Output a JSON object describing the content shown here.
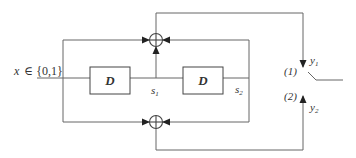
{
  "diagram": {
    "type": "convolutional-encoder",
    "input_label": "x ∈ {0,1}",
    "input_var": "x",
    "input_set": "∈ {0,1}",
    "delay_blocks": [
      {
        "id": "D1",
        "label": "D",
        "output_state": "s",
        "output_sub": "1"
      },
      {
        "id": "D2",
        "label": "D",
        "output_state": "s",
        "output_sub": "2"
      }
    ],
    "adders": [
      {
        "id": "xor-top",
        "symbol": "⊕",
        "inputs": [
          "x",
          "s1",
          "s2"
        ],
        "output": "y1"
      },
      {
        "id": "xor-bottom",
        "symbol": "⊕",
        "inputs": [
          "x",
          "s2"
        ],
        "output": "y2"
      }
    ],
    "switch": {
      "positions": [
        {
          "label": "(1)",
          "output_var": "y",
          "output_sub": "1"
        },
        {
          "label": "(2)",
          "output_var": "y",
          "output_sub": "2"
        }
      ],
      "current_position": "(1)"
    },
    "colors": {
      "line": "#555555",
      "text": "#333333",
      "background": "#ffffff"
    }
  }
}
